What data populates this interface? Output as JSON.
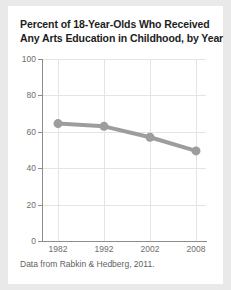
{
  "figure": {
    "background_color": "#ffffff",
    "page_background_color": "#e9e9e9",
    "title_line1": "Percent of 18-Year-Olds Who Received",
    "title_line2": "Any Arts Education in Childhood, by Year",
    "caption": "Data from Rabkin & Hedberg, 2011."
  },
  "chart_data": {
    "type": "line",
    "title": "Percent of 18-Year-Olds Who Received Any Arts Education in Childhood, by Year",
    "subtitle": "",
    "xlabel": "",
    "ylabel": "",
    "categories": [
      "1982",
      "1992",
      "2002",
      "2008"
    ],
    "x": [
      1982,
      1992,
      2002,
      2008
    ],
    "values": [
      64.5,
      63,
      57,
      49.5
    ],
    "series": [
      {
        "name": "Percent receiving any arts education",
        "values": [
          64.5,
          63,
          57,
          49.5
        ],
        "color": "#9d9d9d",
        "marker": "circle",
        "marker_size": 9,
        "line_width": 4
      }
    ],
    "ylim": [
      0,
      100
    ],
    "yticks": [
      0,
      20,
      40,
      60,
      80,
      100
    ],
    "ytick_labels": [
      "0",
      "20",
      "40",
      "60",
      "80",
      "100"
    ],
    "xtick_labels": [
      "1982",
      "1992",
      "2002",
      "2008"
    ],
    "grid": true,
    "grid_color": "#e4e4e4",
    "axis_color": "#8d8d8d",
    "tick_label_color": "#6e6e6e",
    "legend": false,
    "legend_position": "none",
    "annotations": []
  }
}
